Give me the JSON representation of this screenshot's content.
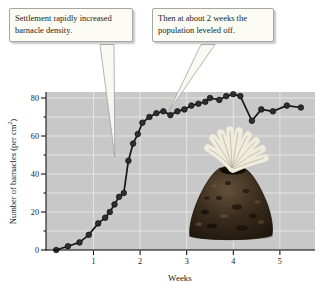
{
  "chart_data": {
    "type": "line",
    "title": "",
    "xlabel": "Weeks",
    "ylabel": "Number of barnacles (per cm2)",
    "ylabel_parts": {
      "main": "Number of barnacles (per cm",
      "sup": "2",
      "close": ")"
    },
    "xlim": [
      0,
      5.75
    ],
    "ylim": [
      0,
      83
    ],
    "xticks": [
      1,
      2,
      3,
      4,
      5
    ],
    "yticks": [
      0,
      20,
      40,
      60,
      80
    ],
    "minor_yticks": [
      10,
      30,
      50,
      70
    ],
    "grid": true,
    "grid_y_step": 10,
    "legend": "none",
    "series": [
      {
        "name": "barnacle density",
        "x": [
          0.2,
          0.45,
          0.7,
          0.9,
          1.1,
          1.25,
          1.35,
          1.45,
          1.55,
          1.65,
          1.75,
          1.85,
          1.95,
          2.05,
          2.2,
          2.35,
          2.5,
          2.65,
          2.8,
          2.95,
          3.1,
          3.25,
          3.4,
          3.5,
          3.7,
          3.85,
          4.0,
          4.15,
          4.4,
          4.6,
          4.85,
          5.15,
          5.45
        ],
        "y": [
          0,
          2,
          4,
          8,
          14,
          17,
          20,
          24,
          28,
          30,
          47,
          56,
          61,
          67,
          70,
          72,
          73,
          71,
          73,
          74,
          76,
          77,
          78,
          80,
          79,
          81,
          82,
          81,
          68,
          74,
          73,
          76,
          75
        ]
      }
    ],
    "annotations": [
      {
        "text": "Settlement rapidly increased barnacle density."
      },
      {
        "text": "Then at about 2 weeks the population leveled off."
      }
    ],
    "colors": {
      "plot_bg": "#c8c8c8",
      "gridline": "#e4e4e2",
      "line": "#161616",
      "marker": "#2e2e2e",
      "axis": "#000000",
      "callout_bg": "#fcfcf4",
      "callout_border": "#a6a6a6"
    }
  },
  "illustration": {
    "name": "acorn barnacle with feeding cirri extended"
  }
}
